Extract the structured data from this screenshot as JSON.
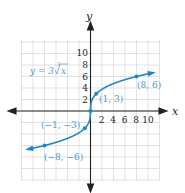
{
  "figure": {
    "equation_prefix": "y = 3",
    "equation_radical_index": "3",
    "equation_radicand": "x",
    "x_axis_label": "x",
    "y_axis_label": "y",
    "x_ticks": [
      "2",
      "4",
      "6",
      "8",
      "10"
    ],
    "y_ticks": [
      "2",
      "4",
      "6",
      "8",
      "10"
    ],
    "points": [
      {
        "label": "(8, 6)",
        "x": 8,
        "y": 6
      },
      {
        "label": "(1, 3)",
        "x": 1,
        "y": 3
      },
      {
        "label": "(0, 0)",
        "x": 0,
        "y": 0
      },
      {
        "label": "(−1, −3)",
        "x": -1,
        "y": -3
      },
      {
        "label": "(−8, −6)",
        "x": -8,
        "y": -6
      }
    ],
    "colors": {
      "curve": "#1e86c6",
      "label": "#4a9bd2",
      "grid": "#d6d6d6",
      "axis": "#222222"
    }
  }
}
